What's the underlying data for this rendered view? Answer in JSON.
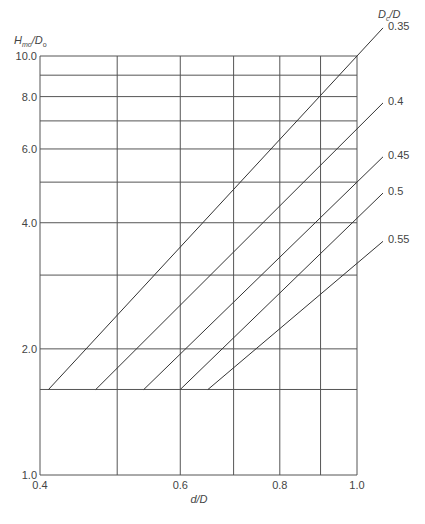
{
  "chart_data": {
    "type": "line",
    "title": "",
    "xlabel": "d/D",
    "ylabel": "H_mo/D_o",
    "ylabel_note": "Subscript read from a blurry crop; 'mo' is a best guess and may be a different abbreviation.",
    "x_scale": "log",
    "y_scale": "log",
    "xlim": [
      0.4,
      1.0
    ],
    "ylim": [
      1.0,
      10.0
    ],
    "x_ticks": [
      0.4,
      0.6,
      0.8,
      1.0
    ],
    "x_tick_labels": [
      "0.4",
      "0.6",
      "0.8",
      "1.0"
    ],
    "x_gridlines": [
      0.4,
      0.5,
      0.6,
      0.7,
      0.8,
      0.9,
      1.0
    ],
    "y_ticks": [
      1.0,
      2.0,
      4.0,
      6.0,
      8.0,
      10.0
    ],
    "y_tick_labels": [
      "1.0",
      "2.0",
      "4.0",
      "6.0",
      "8.0",
      "10.0"
    ],
    "y_gridlines": [
      1.0,
      1.6,
      2.0,
      3.0,
      4.0,
      5.0,
      6.0,
      7.0,
      8.0,
      9.0,
      10.0
    ],
    "grid": true,
    "legend_title": "D_c/D",
    "legend_position": "right, labels at line ends",
    "data_provenance": "No data labels appear on the curves. All x/y values below were estimated by reading pixel positions against the log-scaled gridlines; expect roughly +/-0.01 error on d/D and a few percent on H_mo/D_o.",
    "series": [
      {
        "name": "0.35",
        "x": [
          0.41,
          1.0
        ],
        "y": [
          1.6,
          10.0
        ],
        "estimated": true
      },
      {
        "name": "0.4",
        "x": [
          0.47,
          1.0
        ],
        "y": [
          1.6,
          6.7
        ],
        "estimated": true
      },
      {
        "name": "0.45",
        "x": [
          0.54,
          1.0
        ],
        "y": [
          1.6,
          5.0
        ],
        "estimated": true
      },
      {
        "name": "0.5",
        "x": [
          0.6,
          1.0
        ],
        "y": [
          1.6,
          4.1
        ],
        "estimated": true
      },
      {
        "name": "0.55",
        "x": [
          0.65,
          1.0
        ],
        "y": [
          1.6,
          3.2
        ],
        "estimated": true
      }
    ]
  },
  "labels": {
    "ylabel_main": "H",
    "ylabel_sub1": "mo",
    "ylabel_slash": "/D",
    "ylabel_sub2": "o",
    "legend_main": "D",
    "legend_sub": "c",
    "legend_rest": "/D",
    "xlabel": "d/D"
  },
  "colors": {
    "grid": "#555555",
    "series": "#333333",
    "text": "#444444"
  }
}
